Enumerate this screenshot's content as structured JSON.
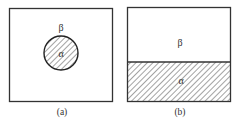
{
  "figure": {
    "panels": [
      {
        "id": "a",
        "caption": "(a)",
        "outer_region_label": "β",
        "inner_region_label": "α",
        "inner_shape": "circle",
        "inner_fill": "hatched"
      },
      {
        "id": "b",
        "caption": "(b)",
        "upper_region_label": "β",
        "lower_region_label": "α",
        "lower_fill": "hatched"
      }
    ],
    "colors": {
      "stroke": "#333333",
      "hatch": "#555555",
      "background": "#ffffff"
    }
  }
}
